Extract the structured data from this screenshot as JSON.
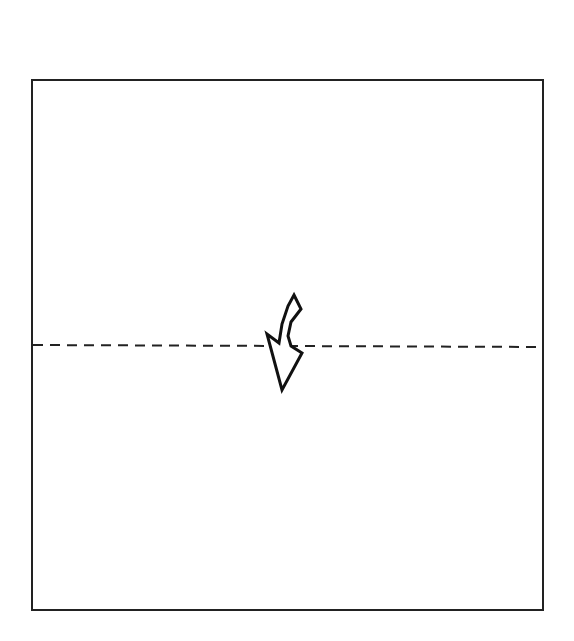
{
  "diagram": {
    "type": "origami-fold-step",
    "paper": {
      "shape": "square",
      "x": 32,
      "y": 80,
      "width": 511,
      "height": 530,
      "stroke": "#222222",
      "fill": "#ffffff"
    },
    "fold_line": {
      "style": "valley-fold-dashed",
      "x1": 33,
      "y1": 345,
      "x2": 543,
      "y2": 347,
      "stroke": "#222222",
      "dash": "10 7"
    },
    "arrow": {
      "icon": "fold-down-arrow-icon",
      "direction": "down",
      "stroke": "#111111",
      "fill": "#ffffff",
      "points": "294,295 301,309 291,322 288,336 291,346 302,353 282,390 267,334 279,343 282,324 288,306"
    }
  }
}
